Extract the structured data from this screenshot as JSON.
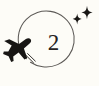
{
  "illustration": {
    "title": "airplane orbiting circular route",
    "center_label": "2",
    "background_color": "#fdfcf7",
    "stroke_color": "#3b3835",
    "orbit_color": "#5d5a57",
    "icons": {
      "airplane": "airplane-icon",
      "orbit_path": "orbit-path",
      "motion_trail": "motion-trail",
      "sparkle_large": "sparkle-icon",
      "sparkle_small": "sparkle-icon"
    },
    "geometry": {
      "orbit_center_x": 50,
      "orbit_center_y": 39,
      "orbit_radius": 28,
      "airplane_x": 22,
      "airplane_y": 46,
      "sparkle_large_x": 86,
      "sparkle_large_y": 13,
      "sparkle_small_x": 77,
      "sparkle_small_y": 19
    }
  }
}
